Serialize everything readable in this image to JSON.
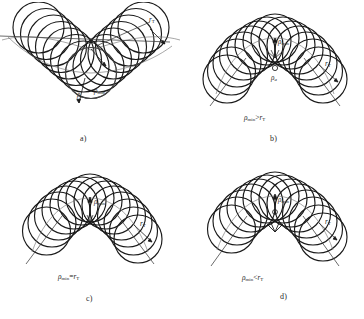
{
  "figure": {
    "background_color": "#ffffff",
    "ink_color": "#1a1a1a",
    "thin_ink_color": "#5a5a5a",
    "panels": [
      {
        "id": "a",
        "letter": "a)",
        "caption": "",
        "labels": {
          "rho_min": "ρ",
          "rho_min_sub": "min",
          "rho_a": "ρ",
          "rho_a_sub": "a",
          "r_t": "r",
          "r_t_sub": "T"
        },
        "shape": "v-cusp",
        "circle_count": 16,
        "has_center_dot": false,
        "has_rho_a": true
      },
      {
        "id": "b",
        "letter": "b)",
        "caption": "ρ",
        "caption_sub": "min",
        "caption_rel": ">",
        "caption_rhs": "r",
        "caption_rhs_sub": "T",
        "labels": {
          "rho_min": "ρ",
          "rho_min_sub": "min",
          "rho_a": "ρ",
          "rho_a_sub": "a",
          "r_t": "r",
          "r_t_sub": "T"
        },
        "shape": "trefoil-cusp",
        "circle_count": 16,
        "has_center_dot": true,
        "has_rho_a": true
      },
      {
        "id": "c",
        "letter": "c)",
        "caption": "ρ",
        "caption_sub": "min",
        "caption_rel": "=",
        "caption_rhs": "r",
        "caption_rhs_sub": "T",
        "labels": {
          "rho_min": "ρ",
          "rho_min_sub": "min",
          "r_t": "r",
          "r_t_sub": "T"
        },
        "shape": "trefoil-cusp",
        "circle_count": 15,
        "has_center_dot": false,
        "has_rho_a": false
      },
      {
        "id": "d",
        "letter": "d)",
        "caption": "ρ",
        "caption_sub": "min",
        "caption_rel": "<",
        "caption_rhs": "r",
        "caption_rhs_sub": "T",
        "labels": {
          "rho_min": "ρ",
          "rho_min_sub": "min",
          "r_t": "r",
          "r_t_sub": "T"
        },
        "shape": "trefoil-cusp",
        "circle_count": 15,
        "has_center_dot": true,
        "has_rho_a": false
      }
    ]
  }
}
